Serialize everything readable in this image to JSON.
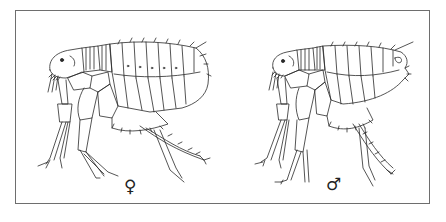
{
  "figure": {
    "panels": [
      {
        "id": "female",
        "label": "♀",
        "subject": "flea-female"
      },
      {
        "id": "male",
        "label": "♂",
        "subject": "flea-male"
      }
    ],
    "line_color": "#2a2a2a",
    "border_color": "#6e6e6e"
  }
}
